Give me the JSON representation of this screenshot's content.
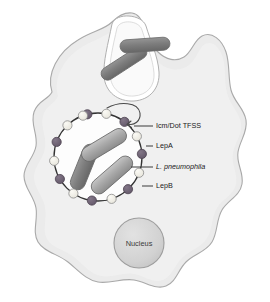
{
  "figure": {
    "background_color": "#ffffff"
  },
  "host_cell": {
    "name": "host-cell",
    "fill_color": "#ebebeb",
    "stroke_color": "#a8a8a8"
  },
  "nucleus": {
    "label": "Nucleus",
    "fill_color": "#d4d4d4",
    "stroke_color": "#9a9a9a",
    "cx": 139,
    "cy": 243,
    "r": 25
  },
  "vacuole": {
    "name": "replication-vacuole",
    "fill_color": "#fdfdfd",
    "stroke_color": "#3a3a3a",
    "cx": 98,
    "cy": 157,
    "r": 44
  },
  "markers": {
    "lepA_color": "#f0eee6",
    "lepA_stroke": "#8a8a8a",
    "lepB_color": "#6f6473",
    "lepB_stroke": "#4e4452",
    "radius": 4.6,
    "ring": [
      {
        "angle": -104,
        "type": "lepB"
      },
      {
        "angle": -79,
        "type": "lepA"
      },
      {
        "angle": -53,
        "type": "lepB"
      },
      {
        "angle": -28,
        "type": "lepA"
      },
      {
        "angle": -4,
        "type": "lepB"
      },
      {
        "angle": 21,
        "type": "lepA"
      },
      {
        "angle": 47,
        "type": "lepB"
      },
      {
        "angle": 72,
        "type": "lepA"
      },
      {
        "angle": 98,
        "type": "lepB"
      },
      {
        "angle": 124,
        "type": "lepA"
      },
      {
        "angle": 150,
        "type": "lepB"
      },
      {
        "angle": 175,
        "type": "lepA"
      },
      {
        "angle": 200,
        "type": "lepB"
      },
      {
        "angle": 226,
        "type": "lepA"
      },
      {
        "angle": 250,
        "type": "lepA"
      }
    ]
  },
  "bacteria": {
    "fill_light": "#b2b2b2",
    "fill_dark": "#787878",
    "stroke_color": "#6a6a6a",
    "inside_vacuole": [
      {
        "cx": 84,
        "cy": 167,
        "length": 48,
        "width": 15,
        "rotation": -68,
        "shade": "dark"
      },
      {
        "cx": 104,
        "cy": 145,
        "length": 50,
        "width": 15,
        "rotation": -31,
        "shade": "light"
      },
      {
        "cx": 112,
        "cy": 175,
        "length": 50,
        "width": 15,
        "rotation": -41,
        "shade": "light"
      }
    ],
    "free": [
      {
        "cx": 124,
        "cy": 63,
        "length": 52,
        "width": 13,
        "rotation": -33,
        "shade": "dark"
      },
      {
        "cx": 145,
        "cy": 45,
        "length": 50,
        "width": 13,
        "rotation": -4,
        "shade": "dark"
      }
    ]
  },
  "secretion_arrow": {
    "name": "icm-dot-secretion-arrow",
    "stroke_color": "#4a4a4a"
  },
  "labels": [
    {
      "id": "icm-dot-tfss",
      "text": "Icm/Dot TFSS",
      "italic": false,
      "text_x": 156,
      "text_y": 126,
      "line_x1": 134,
      "line_y1": 126,
      "line_x2": 153,
      "line_y2": 126
    },
    {
      "id": "lepa",
      "text": "LepA",
      "italic": false,
      "text_x": 156,
      "text_y": 146,
      "line_x1": 146,
      "line_y1": 146,
      "line_x2": 153,
      "line_y2": 146
    },
    {
      "id": "l-pneumophila",
      "text": "L. pneumophila",
      "italic": true,
      "text_x": 156,
      "text_y": 167,
      "line_x1": 131,
      "line_y1": 167,
      "line_x2": 153,
      "line_y2": 167
    },
    {
      "id": "lepb",
      "text": "LepB",
      "italic": false,
      "text_x": 156,
      "text_y": 186,
      "line_x1": 142,
      "line_y1": 186,
      "line_x2": 153,
      "line_y2": 186
    }
  ]
}
